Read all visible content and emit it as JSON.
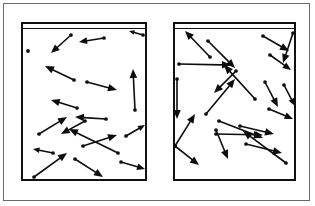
{
  "figure": {
    "background_color": "#ffffff",
    "frame_color": "#6a6a6a",
    "ink_color": "#0d0d0d",
    "wall_color": "#111111",
    "outer_frame": {
      "x": 3,
      "y": 3,
      "width": 307,
      "height": 198
    },
    "panels": [
      {
        "name": "left-container",
        "label": "",
        "x": 20,
        "y": 21,
        "width": 126,
        "height": 159,
        "lid": true,
        "arrow_count": 18,
        "arrows": [
          {
            "x1": 50,
            "y1": 13,
            "x2": 30,
            "y2": 31
          },
          {
            "x1": 83,
            "y1": 16,
            "x2": 58,
            "y2": 20
          },
          {
            "x1": 122,
            "y1": 13,
            "x2": 108,
            "y2": 9
          },
          {
            "x1": 53,
            "y1": 58,
            "x2": 24,
            "y2": 44
          },
          {
            "x1": 66,
            "y1": 60,
            "x2": 96,
            "y2": 68
          },
          {
            "x1": 114,
            "y1": 88,
            "x2": 112,
            "y2": 47
          },
          {
            "x1": 85,
            "y1": 97,
            "x2": 54,
            "y2": 95
          },
          {
            "x1": 18,
            "y1": 112,
            "x2": 46,
            "y2": 95
          },
          {
            "x1": 64,
            "y1": 99,
            "x2": 40,
            "y2": 112
          },
          {
            "x1": 97,
            "y1": 131,
            "x2": 48,
            "y2": 107
          },
          {
            "x1": 105,
            "y1": 114,
            "x2": 124,
            "y2": 103
          },
          {
            "x1": 32,
            "y1": 131,
            "x2": 12,
            "y2": 127
          },
          {
            "x1": 62,
            "y1": 124,
            "x2": 96,
            "y2": 113
          },
          {
            "x1": 54,
            "y1": 137,
            "x2": 82,
            "y2": 155
          },
          {
            "x1": 100,
            "y1": 140,
            "x2": 124,
            "y2": 147
          },
          {
            "x1": 13,
            "y1": 155,
            "x2": 46,
            "y2": 131
          },
          {
            "x1": 7,
            "y1": 29,
            "x2": 7,
            "y2": 29
          },
          {
            "x1": 56,
            "y1": 86,
            "x2": 30,
            "y2": 78
          }
        ]
      },
      {
        "name": "right-container",
        "label": "",
        "x": 172,
        "y": 21,
        "width": 123,
        "height": 159,
        "lid": true,
        "arrow_count": 21,
        "arrows": [
          {
            "x1": 37,
            "y1": 35,
            "x2": 12,
            "y2": 9
          },
          {
            "x1": 35,
            "y1": 19,
            "x2": 62,
            "y2": 46
          },
          {
            "x1": 90,
            "y1": 14,
            "x2": 116,
            "y2": 29
          },
          {
            "x1": 120,
            "y1": 11,
            "x2": 110,
            "y2": 41
          },
          {
            "x1": 6,
            "y1": 42,
            "x2": 58,
            "y2": 43
          },
          {
            "x1": 63,
            "y1": 49,
            "x2": 41,
            "y2": 71
          },
          {
            "x1": 4,
            "y1": 57,
            "x2": 4,
            "y2": 97
          },
          {
            "x1": 82,
            "y1": 77,
            "x2": 51,
            "y2": 43
          },
          {
            "x1": 92,
            "y1": 60,
            "x2": 105,
            "y2": 85
          },
          {
            "x1": 33,
            "y1": 92,
            "x2": 62,
            "y2": 57
          },
          {
            "x1": 2,
            "y1": 124,
            "x2": 22,
            "y2": 92
          },
          {
            "x1": 46,
            "y1": 99,
            "x2": 90,
            "y2": 116
          },
          {
            "x1": 43,
            "y1": 108,
            "x2": 55,
            "y2": 137
          },
          {
            "x1": 2,
            "y1": 124,
            "x2": 26,
            "y2": 143
          },
          {
            "x1": 113,
            "y1": 141,
            "x2": 70,
            "y2": 109
          },
          {
            "x1": 43,
            "y1": 112,
            "x2": 90,
            "y2": 113
          },
          {
            "x1": 73,
            "y1": 122,
            "x2": 109,
            "y2": 131
          },
          {
            "x1": 67,
            "y1": 104,
            "x2": 101,
            "y2": 112
          },
          {
            "x1": 96,
            "y1": 87,
            "x2": 120,
            "y2": 97
          },
          {
            "x1": 111,
            "y1": 63,
            "x2": 122,
            "y2": 84
          },
          {
            "x1": 97,
            "y1": 33,
            "x2": 118,
            "y2": 48
          }
        ]
      }
    ]
  }
}
